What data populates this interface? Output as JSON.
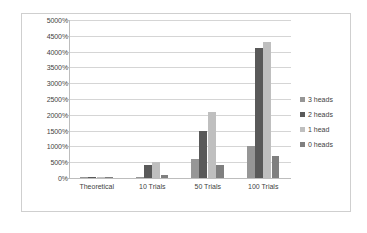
{
  "chart_data": {
    "type": "bar",
    "title": "",
    "xlabel": "",
    "ylabel": "",
    "categories": [
      "Theoretical",
      "10 Trials",
      "50 Trials",
      "100 Trials"
    ],
    "series": [
      {
        "name": "3 heads",
        "color": "#969696",
        "values": [
          12.5,
          0,
          600,
          1000
        ]
      },
      {
        "name": "2 heads",
        "color": "#595959",
        "values": [
          37.5,
          400,
          1500,
          4100
        ]
      },
      {
        "name": "1 head",
        "color": "#bfbfbf",
        "values": [
          37.5,
          500,
          2100,
          4300
        ]
      },
      {
        "name": "0 heads",
        "color": "#7f7f7f",
        "values": [
          12.5,
          100,
          400,
          700
        ]
      }
    ],
    "ylim": [
      0,
      5000
    ],
    "ytick_values": [
      0,
      500,
      1000,
      1500,
      2000,
      2500,
      3000,
      3500,
      4000,
      4500,
      5000
    ],
    "ytick_labels": [
      "0%",
      "500%",
      "1000%",
      "1500%",
      "2000%",
      "2500%",
      "3000%",
      "3500%",
      "4000%",
      "4500%",
      "5000%"
    ],
    "grid": true,
    "legend_position": "right",
    "plot_background": "#ffffff",
    "gridline_color": "#d5d5d5",
    "border_color": "#cfcfcf"
  }
}
